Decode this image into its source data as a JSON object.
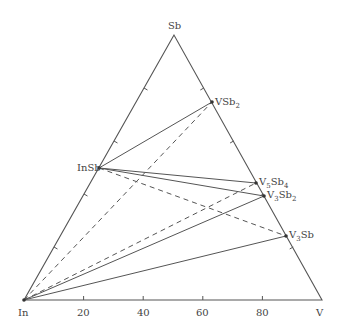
{
  "diagram": {
    "type": "ternary-phase-diagram",
    "vertices": {
      "top": {
        "label": "Sb",
        "x": 174,
        "y": 35
      },
      "left": {
        "label": "In",
        "x": 24,
        "y": 300
      },
      "right": {
        "label": "V",
        "x": 322,
        "y": 300
      }
    },
    "axis_ticks": [
      "20",
      "40",
      "60",
      "80"
    ],
    "phases": [
      {
        "id": "InSb",
        "label": "InSb",
        "x": 99,
        "y": 168
      },
      {
        "id": "VSb2",
        "label": "VSb",
        "sub": "2",
        "x": 212,
        "y": 102
      },
      {
        "id": "V5Sb4",
        "label_a": "V",
        "sub_a": "5",
        "label_b": "Sb",
        "sub_b": "4",
        "x": 256,
        "y": 183
      },
      {
        "id": "V3Sb2",
        "label_a": "V",
        "sub_a": "3",
        "label_b": "Sb",
        "sub_b": "2",
        "x": 264,
        "y": 196
      },
      {
        "id": "V3Sb",
        "label_a": "V",
        "sub_a": "3",
        "label_b": "Sb",
        "x": 286,
        "y": 236
      }
    ],
    "tie_lines": [
      {
        "from": "InSb",
        "to": "VSb2",
        "style": "solid"
      },
      {
        "from": "InSb",
        "to": "V5Sb4",
        "style": "solid"
      },
      {
        "from": "InSb",
        "to": "V3Sb2",
        "style": "solid"
      },
      {
        "from": "InSb",
        "to": "V3Sb",
        "style": "dashed"
      },
      {
        "from": "In",
        "to": "VSb2",
        "style": "dashed"
      },
      {
        "from": "In",
        "to": "V5Sb4",
        "style": "dashed"
      },
      {
        "from": "In",
        "to": "V3Sb2",
        "style": "solid"
      },
      {
        "from": "In",
        "to": "V3Sb",
        "style": "solid"
      }
    ],
    "line_color": "#555555"
  }
}
